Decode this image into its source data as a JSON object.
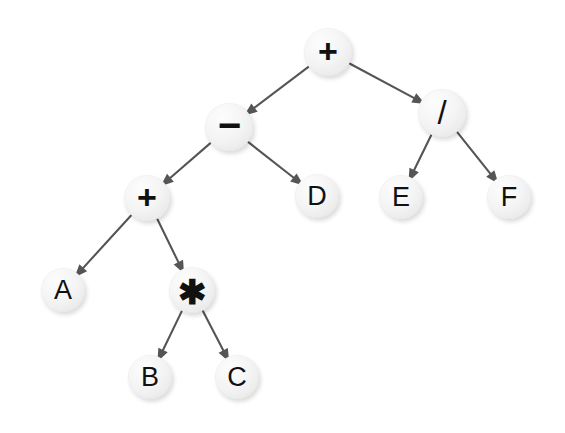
{
  "diagram": {
    "background_color": "#ffffff",
    "node_fill_color": "#f2f2f2",
    "node_text_color": "#111111",
    "edge_color": "#555555",
    "width": 565,
    "height": 433
  },
  "nodes": [
    {
      "id": "root_plus",
      "label": "+",
      "kind": "operator",
      "glyph_class": "label-op-plus",
      "cx": 328,
      "cy": 52,
      "r": 24
    },
    {
      "id": "minus",
      "label": "−",
      "kind": "operator",
      "glyph_class": "label-op-minus",
      "cx": 229,
      "cy": 127,
      "r": 24
    },
    {
      "id": "divide",
      "label": "/",
      "kind": "operator",
      "glyph_class": "label-op-slash",
      "cx": 442,
      "cy": 113,
      "r": 24
    },
    {
      "id": "plus2",
      "label": "+",
      "kind": "operator",
      "glyph_class": "label-op-plus",
      "cx": 147,
      "cy": 198,
      "r": 23
    },
    {
      "id": "leaf_d",
      "label": "D",
      "kind": "operand",
      "glyph_class": "label-letter",
      "cx": 317,
      "cy": 196,
      "r": 22
    },
    {
      "id": "leaf_e",
      "label": "E",
      "kind": "operand",
      "glyph_class": "label-letter",
      "cx": 401,
      "cy": 197,
      "r": 22
    },
    {
      "id": "leaf_f",
      "label": "F",
      "kind": "operand",
      "glyph_class": "label-letter",
      "cx": 509,
      "cy": 197,
      "r": 22
    },
    {
      "id": "leaf_a",
      "label": "A",
      "kind": "operand",
      "glyph_class": "label-letter",
      "cx": 63,
      "cy": 290,
      "r": 22
    },
    {
      "id": "star",
      "label": "✱",
      "kind": "operator",
      "glyph_class": "label-op-star",
      "cx": 192,
      "cy": 290,
      "r": 23
    },
    {
      "id": "leaf_b",
      "label": "B",
      "kind": "operand",
      "glyph_class": "label-letter",
      "cx": 150,
      "cy": 377,
      "r": 22
    },
    {
      "id": "leaf_c",
      "label": "C",
      "kind": "operand",
      "glyph_class": "label-letter",
      "cx": 237,
      "cy": 377,
      "r": 22
    }
  ],
  "edges": [
    {
      "id": "e1",
      "from": "root_plus",
      "to": "minus"
    },
    {
      "id": "e2",
      "from": "root_plus",
      "to": "divide"
    },
    {
      "id": "e3",
      "from": "minus",
      "to": "plus2"
    },
    {
      "id": "e4",
      "from": "minus",
      "to": "leaf_d"
    },
    {
      "id": "e5",
      "from": "divide",
      "to": "leaf_e"
    },
    {
      "id": "e6",
      "from": "divide",
      "to": "leaf_f"
    },
    {
      "id": "e7",
      "from": "plus2",
      "to": "leaf_a"
    },
    {
      "id": "e8",
      "from": "plus2",
      "to": "star"
    },
    {
      "id": "e9",
      "from": "star",
      "to": "leaf_b"
    },
    {
      "id": "e10",
      "from": "star",
      "to": "leaf_c"
    }
  ]
}
